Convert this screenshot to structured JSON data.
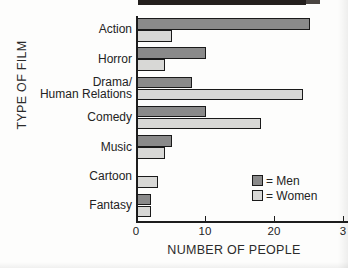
{
  "chart_data": {
    "type": "bar",
    "orientation": "horizontal",
    "title": "",
    "xlabel": "NUMBER OF PEOPLE",
    "ylabel": "TYPE OF FILM",
    "categories": [
      "Action",
      "Horror",
      "Drama/\nHuman Relations",
      "Comedy",
      "Music",
      "Cartoon",
      "Fantasy"
    ],
    "category_lines": [
      [
        "Action"
      ],
      [
        "Horror"
      ],
      [
        "Drama/",
        "Human Relations"
      ],
      [
        "Comedy"
      ],
      [
        "Music"
      ],
      [
        "Cartoon"
      ],
      [
        "Fantasy"
      ]
    ],
    "series": [
      {
        "name": "Men",
        "color": "#8a8a8a",
        "values": [
          25,
          10,
          8,
          10,
          5,
          0,
          2
        ]
      },
      {
        "name": "Women",
        "color": "#d8d8d6",
        "values": [
          5,
          4,
          24,
          18,
          4,
          3,
          2
        ]
      }
    ],
    "xlim": [
      0,
      30
    ],
    "xticks": [
      0,
      10,
      20,
      30
    ],
    "xticklabels": [
      "0",
      "10",
      "20",
      "3"
    ],
    "grid": false,
    "legend_position": "bottom-right"
  },
  "legend": {
    "entries": [
      {
        "equals": "= Men",
        "series": "Men"
      },
      {
        "equals": "= Women",
        "series": "Women"
      }
    ]
  },
  "colors": {
    "men": "#8a8a8a",
    "women": "#d8d8d6",
    "axis": "#1d1d1d",
    "text": "#232323",
    "background": "#fdfdfc"
  }
}
